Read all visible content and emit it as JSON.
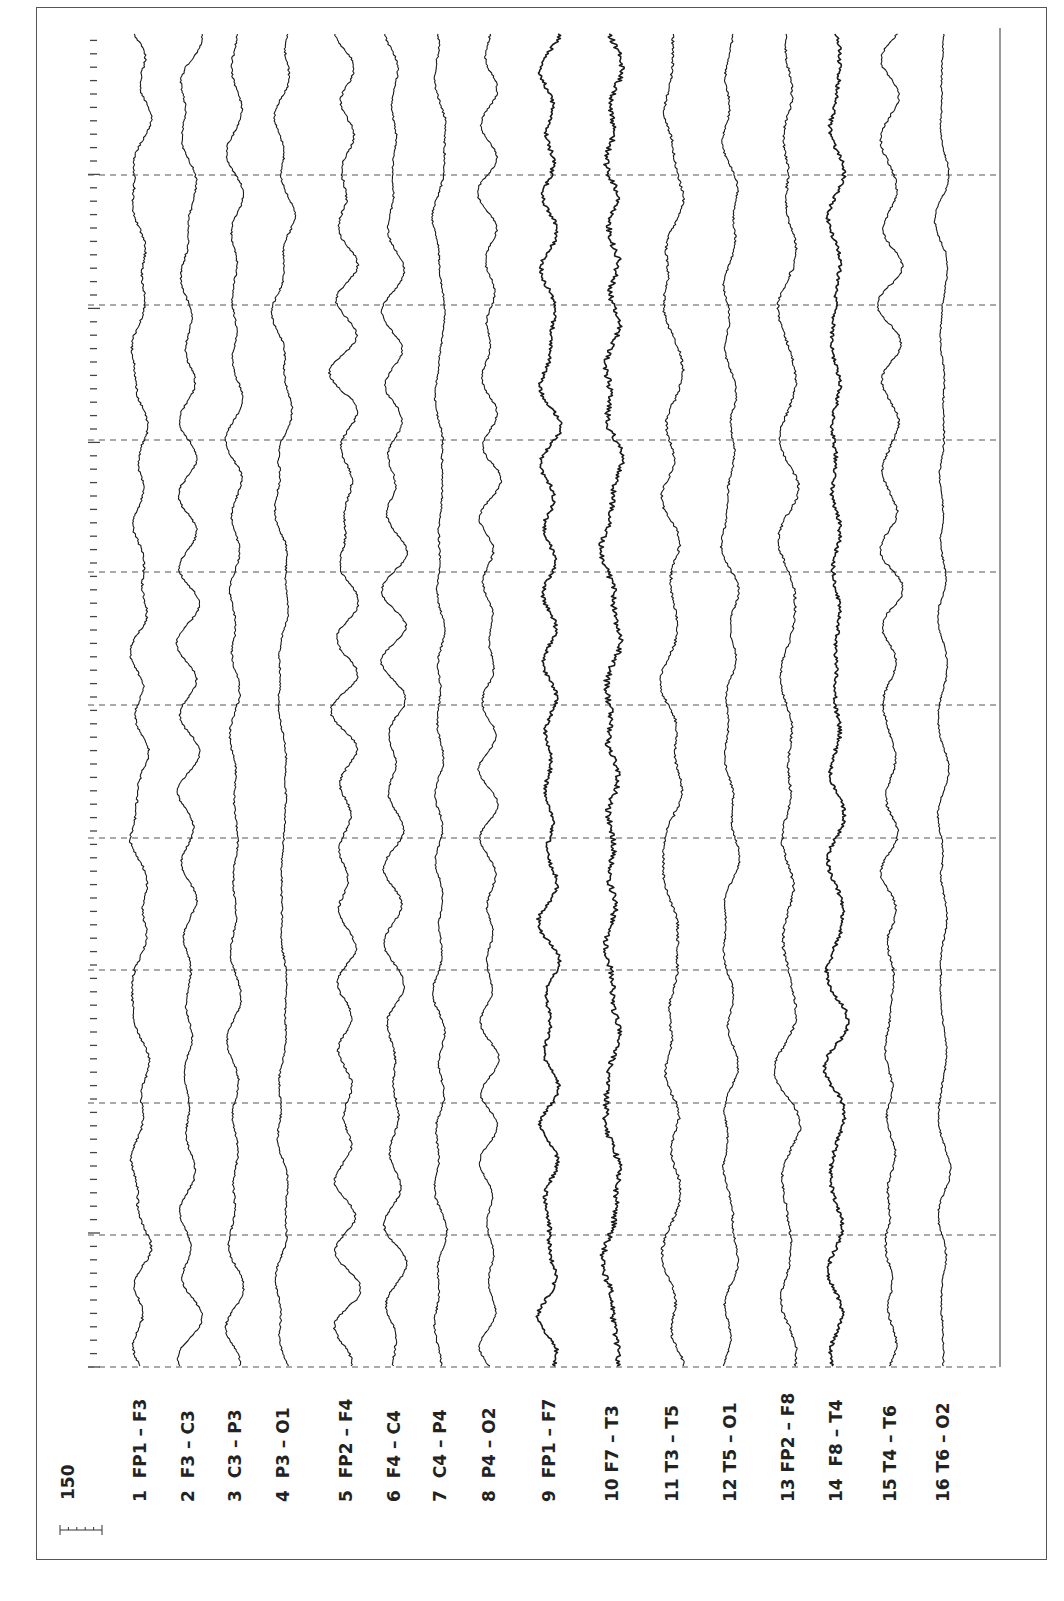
{
  "chart_data": {
    "type": "line",
    "title": "",
    "orientation": "rotated-90-ccw",
    "scale_bar": {
      "label": "150",
      "ticks": 6
    },
    "channels": [
      {
        "index": 1,
        "label": "1  FP1 – F3",
        "x": 140,
        "amp": 9,
        "noise": 1.2,
        "seed": 11
      },
      {
        "index": 2,
        "label": "2  F3 – C3",
        "x": 188,
        "amp": 10,
        "noise": 1.0,
        "seed": 23
      },
      {
        "index": 3,
        "label": "3  C3 – P3",
        "x": 235,
        "amp": 6,
        "noise": 1.0,
        "seed": 37
      },
      {
        "index": 4,
        "label": "4  P3 – O1",
        "x": 283,
        "amp": 7,
        "noise": 1.0,
        "seed": 41
      },
      {
        "index": 5,
        "label": "5  FP2 – F4",
        "x": 346,
        "amp": 10,
        "noise": 1.2,
        "seed": 53
      },
      {
        "index": 6,
        "label": "6  F4 – C4",
        "x": 394,
        "amp": 8,
        "noise": 1.0,
        "seed": 67
      },
      {
        "index": 7,
        "label": "7  C4 – P4",
        "x": 440,
        "amp": 6,
        "noise": 1.0,
        "seed": 71
      },
      {
        "index": 8,
        "label": "8  P4 – O2",
        "x": 489,
        "amp": 7,
        "noise": 1.0,
        "seed": 83
      },
      {
        "index": 9,
        "label": "9  FP1 – F7",
        "x": 549,
        "amp": 7,
        "noise": 2.2,
        "seed": 97
      },
      {
        "index": 10,
        "label": "10 F7 – T3",
        "x": 612,
        "amp": 6,
        "noise": 3.2,
        "seed": 101
      },
      {
        "index": 11,
        "label": "11 T3 – T5",
        "x": 672,
        "amp": 7,
        "noise": 1.4,
        "seed": 113
      },
      {
        "index": 12,
        "label": "12 T5 – O1",
        "x": 730,
        "amp": 6,
        "noise": 1.0,
        "seed": 127
      },
      {
        "index": 13,
        "label": "13 FP2 – F8",
        "x": 788,
        "amp": 8,
        "noise": 1.4,
        "seed": 131
      },
      {
        "index": 14,
        "label": "14  F8 – T4",
        "x": 836,
        "amp": 6,
        "noise": 2.2,
        "seed": 149
      },
      {
        "index": 15,
        "label": "15 T4 – T6",
        "x": 890,
        "amp": 7,
        "noise": 1.2,
        "seed": 151
      },
      {
        "index": 16,
        "label": "16 T6 – O2",
        "x": 943,
        "amp": 5,
        "noise": 0.9,
        "seed": 163
      }
    ],
    "time_gridlines_y": [
      175,
      305,
      440,
      572,
      705,
      838,
      970,
      1103,
      1235,
      1367
    ],
    "trace_region": {
      "top": 30,
      "bottom": 1367,
      "left": 88,
      "right": 1000
    },
    "time_axis_ticks": {
      "x": 92,
      "spacing": 13.4
    },
    "grid": "dashed horizontal time markers",
    "colors": {
      "trace": "#1a1a1a",
      "grid": "#555555",
      "frame": "#555555",
      "background": "#ffffff"
    }
  }
}
